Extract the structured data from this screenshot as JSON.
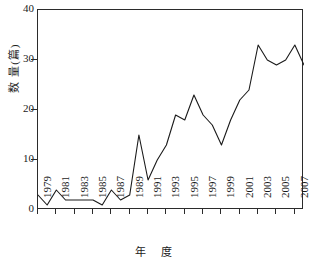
{
  "chart_data": {
    "type": "line",
    "title": "",
    "xlabel": "年 度",
    "ylabel": "数 量(篇)",
    "xlim": [
      1979,
      2008
    ],
    "ylim": [
      0,
      40
    ],
    "grid": false,
    "legend": "none",
    "yticks": [
      0,
      10,
      20,
      30,
      40
    ],
    "ytick_labels": [
      "0",
      "10",
      "20",
      "30",
      "40"
    ],
    "xticks": [
      1979,
      1981,
      1983,
      1985,
      1987,
      1989,
      1991,
      1993,
      1995,
      1997,
      1999,
      2001,
      2003,
      2005,
      2007
    ],
    "xtick_labels": [
      "1979",
      "1981",
      "1983",
      "1985",
      "1987",
      "1989",
      "1991",
      "1993",
      "1995",
      "1997",
      "1999",
      "2001",
      "2003",
      "2005",
      "2007"
    ],
    "line_color": "#1a1a1a",
    "x": [
      1979,
      1980,
      1981,
      1982,
      1983,
      1984,
      1985,
      1986,
      1987,
      1988,
      1989,
      1990,
      1991,
      1992,
      1993,
      1994,
      1995,
      1996,
      1997,
      1998,
      1999,
      2000,
      2001,
      2002,
      2003,
      2004,
      2005,
      2006,
      2007,
      2008
    ],
    "values": [
      3,
      1,
      4,
      2,
      2,
      2,
      2,
      1,
      4,
      2,
      3,
      15,
      6,
      10,
      13,
      19,
      18,
      23,
      19,
      17,
      13,
      18,
      22,
      24,
      33,
      30,
      29,
      30,
      33,
      29
    ],
    "series": [
      {
        "name": "数量(篇)",
        "values": [
          3,
          1,
          4,
          2,
          2,
          2,
          2,
          1,
          4,
          2,
          3,
          15,
          6,
          10,
          13,
          19,
          18,
          23,
          19,
          17,
          13,
          18,
          22,
          24,
          33,
          30,
          29,
          30,
          33,
          29
        ]
      }
    ]
  }
}
